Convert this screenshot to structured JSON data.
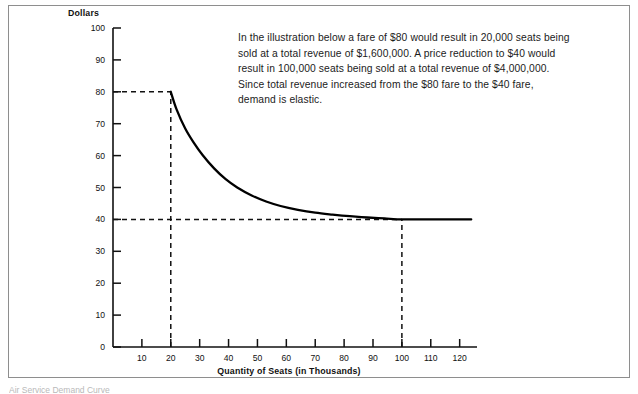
{
  "figure": {
    "annotation": "In the illustration below a fare of $80 would result in 20,000 seats being sold at a total revenue of $1,600,000. A price reduction to $40 would result in 100,000 seats being sold at a total revenue of $4,000,000. Since total revenue increased from the $80 fare to the $40 fare, demand is elastic.",
    "caption": "Air Service Demand Curve"
  },
  "chart_data": {
    "type": "line",
    "title": "",
    "xlabel": "Quantity of Seats (in Thousands)",
    "ylabel": "Dollars",
    "xlim": [
      0,
      126
    ],
    "ylim": [
      0,
      100
    ],
    "grid": false,
    "legend": "none",
    "xticks": [
      10,
      20,
      30,
      40,
      50,
      60,
      70,
      80,
      90,
      100,
      110,
      120
    ],
    "yticks": [
      0,
      10,
      20,
      30,
      40,
      50,
      60,
      70,
      80,
      90,
      100
    ],
    "series": [
      {
        "name": "Demand Curve",
        "x": [
          20,
          22,
          25,
          28,
          31,
          35,
          39,
          43,
          48,
          53,
          58,
          64,
          70,
          76,
          82,
          88,
          94,
          100,
          108,
          116,
          124
        ],
        "y": [
          80,
          74.5,
          68.5,
          64.0,
          60.2,
          56.0,
          52.6,
          50.0,
          47.5,
          45.6,
          44.2,
          43.0,
          42.1,
          41.5,
          41.0,
          40.6,
          40.3,
          40.0,
          40.0,
          40.0,
          40.0
        ]
      }
    ],
    "annotations": [
      {
        "name": "price-80-guide",
        "type": "hline",
        "value": 80,
        "style": "dashed",
        "from_x": 0,
        "to_x": 20
      },
      {
        "name": "price-40-guide",
        "type": "hline",
        "value": 40,
        "style": "dashed",
        "from_x": 0,
        "to_x": 100
      },
      {
        "name": "quantity-20-guide",
        "type": "vline",
        "value": 20,
        "style": "dashed",
        "from_y": 0,
        "to_y": 80
      },
      {
        "name": "quantity-100-guide",
        "type": "vline",
        "value": 100,
        "style": "dashed",
        "from_y": 0,
        "to_y": 40
      }
    ],
    "points_of_interest": [
      {
        "label": "Fare $80 / 20,000 seats",
        "x": 20,
        "y": 80,
        "total_revenue": 1600000
      },
      {
        "label": "Fare $40 / 100,000 seats",
        "x": 100,
        "y": 40,
        "total_revenue": 4000000
      }
    ]
  }
}
